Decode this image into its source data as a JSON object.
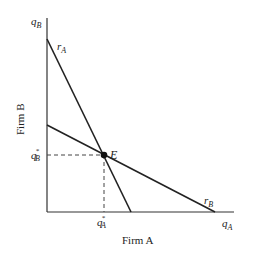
{
  "diagram": {
    "x_axis_label": "Firm A",
    "y_axis_label": "Firm B",
    "x_axis_var": "q",
    "x_axis_sub": "A",
    "y_axis_var": "q",
    "y_axis_sub": "B",
    "curves": [
      {
        "name": "r",
        "sub": "A",
        "from": [
          47,
          39
        ],
        "to": [
          131,
          212
        ]
      },
      {
        "name": "r",
        "sub": "B",
        "from": [
          47,
          125
        ],
        "to": [
          215,
          212
        ]
      }
    ],
    "equilibrium": {
      "label": "E",
      "point": [
        104,
        155
      ]
    },
    "x_star": {
      "var": "q",
      "sup": "*",
      "sub": "A"
    },
    "y_star": {
      "var": "q",
      "sup": "*",
      "sub": "B"
    },
    "colors": {
      "line": "#222222",
      "background": "#ffffff"
    }
  }
}
